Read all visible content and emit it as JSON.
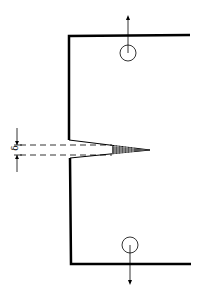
{
  "diagram": {
    "labels": {
      "delta": "δ"
    },
    "colors": {
      "stroke": "#000000",
      "background": "#ffffff"
    },
    "elements": [
      "specimen-outline",
      "notch",
      "crack-tip-fatigue-zone",
      "top-load-pin-hole",
      "bottom-load-pin-hole",
      "top-load-arrow",
      "bottom-load-arrow",
      "crack-opening-dimension"
    ]
  }
}
